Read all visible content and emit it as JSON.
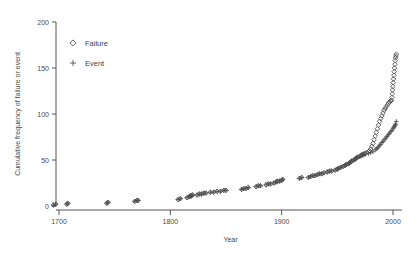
{
  "chart_data": {
    "type": "scatter",
    "title": "",
    "xlabel": "Year",
    "ylabel": "Cumulative frequency of failure or event",
    "xlim": [
      1685,
      2008
    ],
    "ylim": [
      0,
      200
    ],
    "xticks": [
      1700,
      1800,
      1900,
      2000
    ],
    "yticks": [
      0,
      50,
      100,
      150,
      200
    ],
    "grid": false,
    "legend_position": "upper-left",
    "series": [
      {
        "name": "Failure",
        "marker": "diamond",
        "color": "#4c4c4c",
        "points": [
          [
            1695,
            1
          ],
          [
            1697,
            2
          ],
          [
            1707,
            2
          ],
          [
            1708,
            3
          ],
          [
            1743,
            3
          ],
          [
            1744,
            4
          ],
          [
            1768,
            5
          ],
          [
            1770,
            6
          ],
          [
            1771,
            6
          ],
          [
            1807,
            7
          ],
          [
            1809,
            8
          ],
          [
            1815,
            9
          ],
          [
            1817,
            10
          ],
          [
            1818,
            11
          ],
          [
            1819,
            11
          ],
          [
            1820,
            12
          ],
          [
            1824,
            12
          ],
          [
            1826,
            13
          ],
          [
            1828,
            13
          ],
          [
            1830,
            14
          ],
          [
            1832,
            14
          ],
          [
            1836,
            15
          ],
          [
            1839,
            15
          ],
          [
            1842,
            16
          ],
          [
            1845,
            16
          ],
          [
            1848,
            17
          ],
          [
            1850,
            17
          ],
          [
            1864,
            18
          ],
          [
            1866,
            19
          ],
          [
            1868,
            19
          ],
          [
            1870,
            20
          ],
          [
            1877,
            21
          ],
          [
            1879,
            22
          ],
          [
            1881,
            22
          ],
          [
            1886,
            23
          ],
          [
            1888,
            24
          ],
          [
            1890,
            24
          ],
          [
            1893,
            25
          ],
          [
            1895,
            26
          ],
          [
            1896,
            27
          ],
          [
            1898,
            27
          ],
          [
            1900,
            28
          ],
          [
            1901,
            29
          ],
          [
            1916,
            30
          ],
          [
            1918,
            31
          ],
          [
            1924,
            31
          ],
          [
            1926,
            32
          ],
          [
            1928,
            33
          ],
          [
            1930,
            33
          ],
          [
            1932,
            34
          ],
          [
            1934,
            35
          ],
          [
            1936,
            35
          ],
          [
            1938,
            36
          ],
          [
            1941,
            37
          ],
          [
            1943,
            38
          ],
          [
            1945,
            38
          ],
          [
            1948,
            39
          ],
          [
            1950,
            40
          ],
          [
            1951,
            41
          ],
          [
            1953,
            42
          ],
          [
            1955,
            43
          ],
          [
            1957,
            44
          ],
          [
            1958,
            45
          ],
          [
            1960,
            46
          ],
          [
            1961,
            47
          ],
          [
            1962,
            48
          ],
          [
            1963,
            49
          ],
          [
            1965,
            50
          ],
          [
            1966,
            51
          ],
          [
            1967,
            52
          ],
          [
            1968,
            53
          ],
          [
            1970,
            54
          ],
          [
            1971,
            55
          ],
          [
            1972,
            56
          ],
          [
            1973,
            56
          ],
          [
            1974,
            57
          ],
          [
            1975,
            57
          ],
          [
            1976,
            58
          ],
          [
            1978,
            59
          ],
          [
            1979,
            60
          ],
          [
            1980,
            62
          ],
          [
            1981,
            65
          ],
          [
            1982,
            68
          ],
          [
            1983,
            72
          ],
          [
            1984,
            76
          ],
          [
            1985,
            80
          ],
          [
            1986,
            84
          ],
          [
            1987,
            88
          ],
          [
            1988,
            92
          ],
          [
            1989,
            95
          ],
          [
            1990,
            98
          ],
          [
            1991,
            101
          ],
          [
            1992,
            104
          ],
          [
            1993,
            106
          ],
          [
            1994,
            108
          ],
          [
            1995,
            110
          ],
          [
            1996,
            112
          ],
          [
            1997,
            113
          ],
          [
            1998,
            114
          ],
          [
            1998.5,
            115
          ],
          [
            1999,
            118
          ],
          [
            1999.3,
            122
          ],
          [
            1999.6,
            126
          ],
          [
            1999.9,
            130
          ],
          [
            2000.2,
            134
          ],
          [
            2000.5,
            138
          ],
          [
            2000.8,
            142
          ],
          [
            2001.1,
            146
          ],
          [
            2001.4,
            150
          ],
          [
            2001.7,
            154
          ],
          [
            2002,
            158
          ],
          [
            2002.3,
            161
          ],
          [
            2002.6,
            163
          ],
          [
            2003,
            165
          ]
        ]
      },
      {
        "name": "Event",
        "marker": "plus",
        "color": "#4c4c4c",
        "points": [
          [
            1695,
            1
          ],
          [
            1697,
            2
          ],
          [
            1707,
            2
          ],
          [
            1708,
            3
          ],
          [
            1743,
            3
          ],
          [
            1744,
            4
          ],
          [
            1768,
            5
          ],
          [
            1770,
            6
          ],
          [
            1771,
            6
          ],
          [
            1807,
            7
          ],
          [
            1809,
            8
          ],
          [
            1815,
            9
          ],
          [
            1817,
            10
          ],
          [
            1818,
            11
          ],
          [
            1819,
            11
          ],
          [
            1820,
            12
          ],
          [
            1824,
            12
          ],
          [
            1826,
            13
          ],
          [
            1828,
            13
          ],
          [
            1830,
            14
          ],
          [
            1832,
            14
          ],
          [
            1836,
            15
          ],
          [
            1839,
            15
          ],
          [
            1842,
            16
          ],
          [
            1845,
            16
          ],
          [
            1848,
            17
          ],
          [
            1850,
            17
          ],
          [
            1864,
            18
          ],
          [
            1866,
            19
          ],
          [
            1868,
            19
          ],
          [
            1870,
            20
          ],
          [
            1877,
            21
          ],
          [
            1879,
            22
          ],
          [
            1881,
            22
          ],
          [
            1886,
            23
          ],
          [
            1888,
            24
          ],
          [
            1890,
            24
          ],
          [
            1893,
            25
          ],
          [
            1895,
            26
          ],
          [
            1896,
            27
          ],
          [
            1898,
            27
          ],
          [
            1900,
            28
          ],
          [
            1901,
            29
          ],
          [
            1916,
            30
          ],
          [
            1918,
            31
          ],
          [
            1924,
            31
          ],
          [
            1926,
            32
          ],
          [
            1928,
            33
          ],
          [
            1930,
            33
          ],
          [
            1932,
            34
          ],
          [
            1934,
            35
          ],
          [
            1936,
            35
          ],
          [
            1938,
            36
          ],
          [
            1941,
            37
          ],
          [
            1943,
            38
          ],
          [
            1945,
            38
          ],
          [
            1948,
            39
          ],
          [
            1950,
            40
          ],
          [
            1951,
            41
          ],
          [
            1953,
            42
          ],
          [
            1955,
            43
          ],
          [
            1957,
            44
          ],
          [
            1958,
            45
          ],
          [
            1960,
            46
          ],
          [
            1961,
            47
          ],
          [
            1962,
            48
          ],
          [
            1963,
            49
          ],
          [
            1965,
            50
          ],
          [
            1966,
            51
          ],
          [
            1967,
            52
          ],
          [
            1968,
            53
          ],
          [
            1970,
            54
          ],
          [
            1971,
            54
          ],
          [
            1972,
            55
          ],
          [
            1973,
            55
          ],
          [
            1974,
            56
          ],
          [
            1975,
            56
          ],
          [
            1978,
            57
          ],
          [
            1980,
            58
          ],
          [
            1982,
            59
          ],
          [
            1984,
            61
          ],
          [
            1985,
            62
          ],
          [
            1986,
            63
          ],
          [
            1987,
            64
          ],
          [
            1988,
            66
          ],
          [
            1989,
            67
          ],
          [
            1990,
            69
          ],
          [
            1991,
            70
          ],
          [
            1992,
            72
          ],
          [
            1993,
            73
          ],
          [
            1994,
            75
          ],
          [
            1995,
            76
          ],
          [
            1996,
            78
          ],
          [
            1997,
            79
          ],
          [
            1998,
            81
          ],
          [
            1999,
            82
          ],
          [
            2000,
            84
          ],
          [
            2000.5,
            85
          ],
          [
            2001,
            86
          ],
          [
            2001.5,
            87
          ],
          [
            2002,
            88
          ],
          [
            2002.5,
            89
          ],
          [
            2003,
            92
          ]
        ]
      }
    ]
  },
  "legend": {
    "items": [
      {
        "label": "Failure",
        "marker": "diamond"
      },
      {
        "label": "Event",
        "marker": "plus"
      }
    ]
  }
}
